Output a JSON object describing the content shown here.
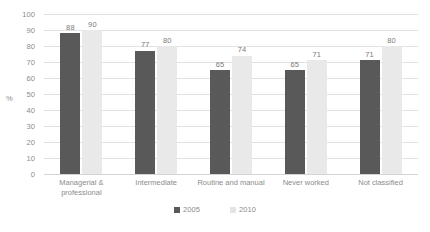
{
  "chart_data": {
    "type": "bar",
    "title": "",
    "subtitle": "",
    "xlabel": "",
    "ylabel": "%",
    "ylim": [
      0,
      100
    ],
    "ytick_step": 10,
    "ytick_labels": [
      "100",
      "90",
      "80",
      "70",
      "60",
      "50",
      "40",
      "30",
      "20",
      "10",
      "0"
    ],
    "grid": true,
    "legend_position": "bottom-center",
    "categories": [
      "Managerial & professional",
      "Intermediate",
      "Routine and manual",
      "Never worked",
      "Not classified"
    ],
    "series": [
      {
        "name": "2005",
        "color": "#595959",
        "values": [
          88,
          77,
          65,
          65,
          71
        ],
        "labels": [
          "88",
          "77",
          "65",
          "65",
          "71"
        ]
      },
      {
        "name": "2010",
        "color": "#e9e9e9",
        "values": [
          90,
          80,
          74,
          71,
          80
        ],
        "labels": [
          "90",
          "80",
          "74",
          "71",
          "80"
        ]
      }
    ]
  },
  "legend": {
    "items": [
      {
        "label": "2005",
        "swatch": "legend-swatch-2005"
      },
      {
        "label": "2010",
        "swatch": "legend-swatch-2010"
      }
    ]
  }
}
